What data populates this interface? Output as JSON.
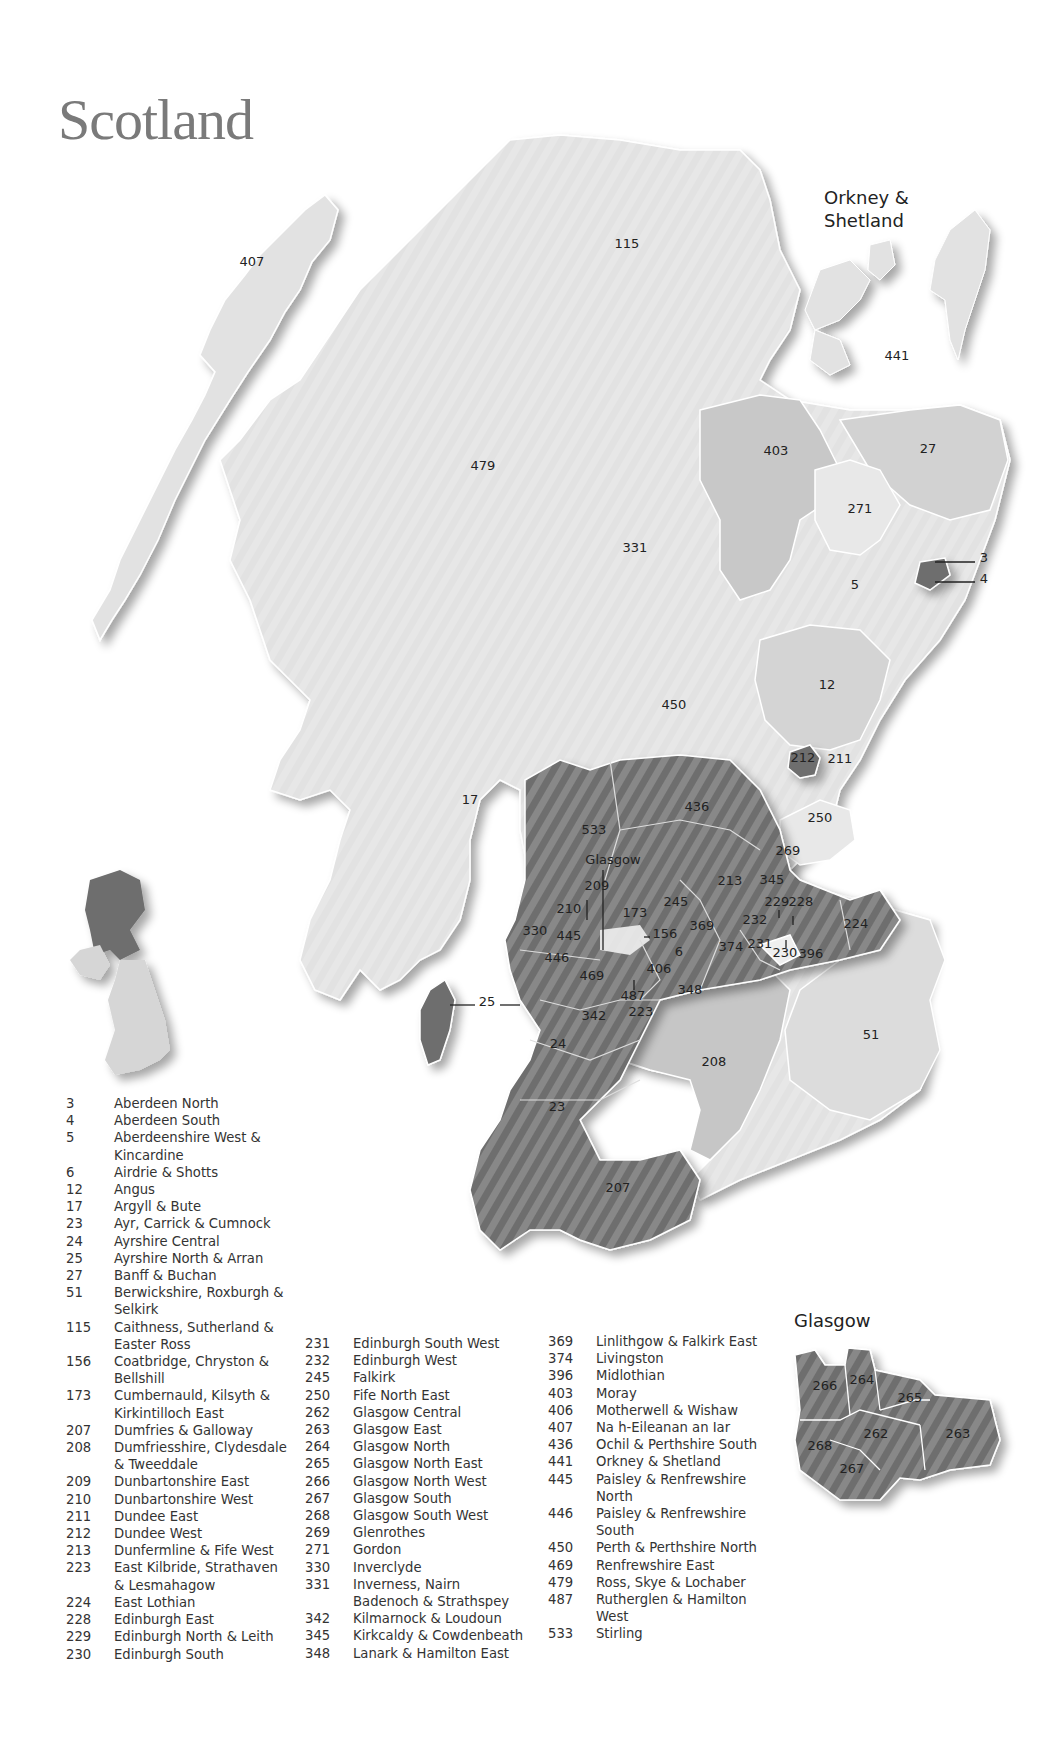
{
  "title": "Scotland",
  "inset_labels": {
    "orkney_shetland": [
      "Orkney &",
      "Shetland"
    ],
    "glasgow_pointer": "Glasgow",
    "glasgow_inset_title": "Glasgow"
  },
  "colors": {
    "light": "#e2e2e2",
    "medium": "#c4c4c4",
    "dark": "#6e6e6e",
    "border": "#ffffff",
    "title": "#7a7a7a"
  },
  "map_labels": [
    {
      "id": "407",
      "x": 252,
      "y": 266
    },
    {
      "id": "115",
      "x": 627,
      "y": 248
    },
    {
      "id": "441",
      "x": 897,
      "y": 360
    },
    {
      "id": "479",
      "x": 483,
      "y": 470
    },
    {
      "id": "331",
      "x": 635,
      "y": 552
    },
    {
      "id": "403",
      "x": 776,
      "y": 455
    },
    {
      "id": "27",
      "x": 928,
      "y": 453
    },
    {
      "id": "271",
      "x": 860,
      "y": 513
    },
    {
      "id": "5",
      "x": 855,
      "y": 589
    },
    {
      "id": "3",
      "x": 984,
      "y": 562
    },
    {
      "id": "4",
      "x": 984,
      "y": 583
    },
    {
      "id": "12",
      "x": 827,
      "y": 689
    },
    {
      "id": "450",
      "x": 674,
      "y": 709
    },
    {
      "id": "212",
      "x": 803,
      "y": 762
    },
    {
      "id": "211",
      "x": 840,
      "y": 763
    },
    {
      "id": "17",
      "x": 470,
      "y": 804
    },
    {
      "id": "436",
      "x": 697,
      "y": 811
    },
    {
      "id": "250",
      "x": 820,
      "y": 822
    },
    {
      "id": "533",
      "x": 594,
      "y": 834
    },
    {
      "id": "269",
      "x": 788,
      "y": 855
    },
    {
      "id": "213",
      "x": 730,
      "y": 885
    },
    {
      "id": "345",
      "x": 772,
      "y": 884
    },
    {
      "id": "209",
      "x": 597,
      "y": 890
    },
    {
      "id": "210",
      "x": 569,
      "y": 913
    },
    {
      "id": "173",
      "x": 635,
      "y": 917
    },
    {
      "id": "245",
      "x": 676,
      "y": 906
    },
    {
      "id": "229",
      "x": 777,
      "y": 906
    },
    {
      "id": "228",
      "x": 801,
      "y": 906
    },
    {
      "id": "224",
      "x": 856,
      "y": 928
    },
    {
      "id": "330",
      "x": 535,
      "y": 935
    },
    {
      "id": "445",
      "x": 569,
      "y": 940
    },
    {
      "id": "156",
      "x": 665,
      "y": 938
    },
    {
      "id": "369",
      "x": 702,
      "y": 930
    },
    {
      "id": "232",
      "x": 755,
      "y": 924
    },
    {
      "id": "374",
      "x": 731,
      "y": 951
    },
    {
      "id": "231",
      "x": 760,
      "y": 948
    },
    {
      "id": "230",
      "x": 785,
      "y": 957
    },
    {
      "id": "396",
      "x": 811,
      "y": 958
    },
    {
      "id": "6",
      "x": 679,
      "y": 956
    },
    {
      "id": "446",
      "x": 557,
      "y": 962
    },
    {
      "id": "406",
      "x": 659,
      "y": 973
    },
    {
      "id": "469",
      "x": 592,
      "y": 980
    },
    {
      "id": "348",
      "x": 690,
      "y": 994
    },
    {
      "id": "487",
      "x": 633,
      "y": 1000
    },
    {
      "id": "25",
      "x": 487,
      "y": 1006
    },
    {
      "id": "223",
      "x": 641,
      "y": 1016
    },
    {
      "id": "342",
      "x": 594,
      "y": 1020
    },
    {
      "id": "24",
      "x": 558,
      "y": 1048
    },
    {
      "id": "51",
      "x": 871,
      "y": 1039
    },
    {
      "id": "208",
      "x": 714,
      "y": 1066
    },
    {
      "id": "23",
      "x": 557,
      "y": 1111
    },
    {
      "id": "207",
      "x": 618,
      "y": 1192
    }
  ],
  "glasgow_inset_labels": [
    {
      "id": "266",
      "x": 825,
      "y": 1390
    },
    {
      "id": "264",
      "x": 862,
      "y": 1384
    },
    {
      "id": "265",
      "x": 910,
      "y": 1402
    },
    {
      "id": "262",
      "x": 876,
      "y": 1438
    },
    {
      "id": "263",
      "x": 958,
      "y": 1438
    },
    {
      "id": "268",
      "x": 820,
      "y": 1450
    },
    {
      "id": "267",
      "x": 852,
      "y": 1473
    }
  ],
  "legend_col1": [
    {
      "num": "3",
      "name": "Aberdeen North"
    },
    {
      "num": "4",
      "name": "Aberdeen South"
    },
    {
      "num": "5",
      "name": "Aberdeenshire West &"
    },
    {
      "num": "",
      "name": "Kincardine"
    },
    {
      "num": "6",
      "name": "Airdrie & Shotts"
    },
    {
      "num": "12",
      "name": "Angus"
    },
    {
      "num": "17",
      "name": "Argyll & Bute"
    },
    {
      "num": "23",
      "name": "Ayr, Carrick & Cumnock"
    },
    {
      "num": "24",
      "name": "Ayrshire Central"
    },
    {
      "num": "25",
      "name": "Ayrshire North & Arran"
    },
    {
      "num": "27",
      "name": "Banff & Buchan"
    },
    {
      "num": "51",
      "name": "Berwickshire, Roxburgh &"
    },
    {
      "num": "",
      "name": "Selkirk"
    },
    {
      "num": "115",
      "name": "Caithness, Sutherland &"
    },
    {
      "num": "",
      "name": "Easter Ross"
    },
    {
      "num": "156",
      "name": "Coatbridge, Chryston &"
    },
    {
      "num": "",
      "name": "Bellshill"
    },
    {
      "num": "173",
      "name": "Cumbernauld, Kilsyth &"
    },
    {
      "num": "",
      "name": "Kirkintilloch East"
    },
    {
      "num": "207",
      "name": "Dumfries & Galloway"
    },
    {
      "num": "208",
      "name": "Dumfriesshire, Clydesdale"
    },
    {
      "num": "",
      "name": "& Tweeddale"
    },
    {
      "num": "209",
      "name": "Dunbartonshire East"
    },
    {
      "num": "210",
      "name": "Dunbartonshire West"
    },
    {
      "num": "211",
      "name": "Dundee East"
    },
    {
      "num": "212",
      "name": "Dundee West"
    },
    {
      "num": "213",
      "name": "Dunfermline & Fife West"
    },
    {
      "num": "223",
      "name": "East Kilbride, Strathaven"
    },
    {
      "num": "",
      "name": "& Lesmahagow"
    },
    {
      "num": "224",
      "name": "East Lothian"
    },
    {
      "num": "228",
      "name": "Edinburgh East"
    },
    {
      "num": "229",
      "name": "Edinburgh North & Leith"
    },
    {
      "num": "230",
      "name": "Edinburgh South"
    }
  ],
  "legend_col2": [
    {
      "num": "231",
      "name": "Edinburgh South West"
    },
    {
      "num": "232",
      "name": "Edinburgh West"
    },
    {
      "num": "245",
      "name": "Falkirk"
    },
    {
      "num": "250",
      "name": "Fife North East"
    },
    {
      "num": "262",
      "name": "Glasgow Central"
    },
    {
      "num": "263",
      "name": "Glasgow East"
    },
    {
      "num": "264",
      "name": "Glasgow North"
    },
    {
      "num": "265",
      "name": "Glasgow North East"
    },
    {
      "num": "266",
      "name": "Glasgow North West"
    },
    {
      "num": "267",
      "name": "Glasgow South"
    },
    {
      "num": "268",
      "name": "Glasgow South West"
    },
    {
      "num": "269",
      "name": "Glenrothes"
    },
    {
      "num": "271",
      "name": "Gordon"
    },
    {
      "num": "330",
      "name": "Inverclyde"
    },
    {
      "num": "331",
      "name": "Inverness, Nairn"
    },
    {
      "num": "",
      "name": "Badenoch & Strathspey"
    },
    {
      "num": "342",
      "name": "Kilmarnock & Loudoun"
    },
    {
      "num": "345",
      "name": "Kirkcaldy & Cowdenbeath"
    },
    {
      "num": "348",
      "name": "Lanark & Hamilton East"
    }
  ],
  "legend_col3": [
    {
      "num": "369",
      "name": "Linlithgow & Falkirk East"
    },
    {
      "num": "374",
      "name": "Livingston"
    },
    {
      "num": "396",
      "name": "Midlothian"
    },
    {
      "num": "403",
      "name": "Moray"
    },
    {
      "num": "406",
      "name": "Motherwell & Wishaw"
    },
    {
      "num": "407",
      "name": "Na h-Eileanan an Iar"
    },
    {
      "num": "436",
      "name": "Ochil & Perthshire South"
    },
    {
      "num": "441",
      "name": "Orkney & Shetland"
    },
    {
      "num": "445",
      "name": "Paisley & Renfrewshire"
    },
    {
      "num": "",
      "name": "North"
    },
    {
      "num": "446",
      "name": "Paisley & Renfrewshire"
    },
    {
      "num": "",
      "name": "South"
    },
    {
      "num": "450",
      "name": "Perth & Perthshire North"
    },
    {
      "num": "469",
      "name": "Renfrewshire East"
    },
    {
      "num": "479",
      "name": "Ross, Skye & Lochaber"
    },
    {
      "num": "487",
      "name": "Rutherglen & Hamilton"
    },
    {
      "num": "",
      "name": "West"
    },
    {
      "num": "533",
      "name": "Stirling"
    }
  ]
}
